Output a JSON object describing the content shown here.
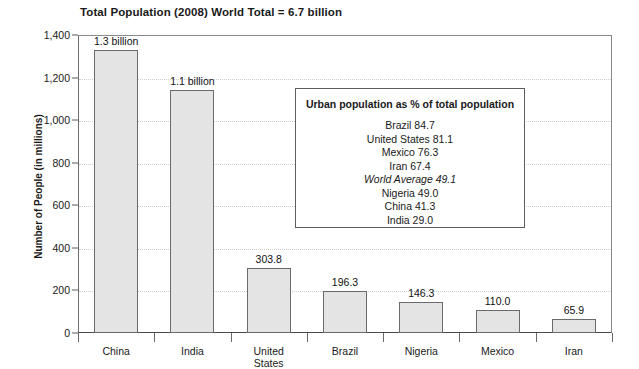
{
  "chart_data": {
    "type": "bar",
    "title": "Total Population (2008) World Total = 6.7 billion",
    "xlabel": "",
    "ylabel": "Number of People (in millions)",
    "ylim": [
      0,
      1400
    ],
    "yticks": [
      0,
      200,
      400,
      600,
      800,
      1000,
      1200,
      1400
    ],
    "ytick_labels": [
      "0",
      "200",
      "400",
      "600",
      "800",
      "1,000",
      "1,200",
      "1,400"
    ],
    "grid": true,
    "legend_position": "inside-upper-right",
    "categories": [
      "China",
      "India",
      "United\nStates",
      "Brazil",
      "Nigeria",
      "Mexico",
      "Iran"
    ],
    "values": [
      1330,
      1140,
      303.8,
      196.3,
      146.3,
      110.0,
      65.9
    ],
    "data_labels": [
      "1.3 billion",
      "1.1 billion",
      "303.8",
      "196.3",
      "146.3",
      "110.0",
      "65.9"
    ],
    "bar_fill_color": "#e4e4e4",
    "bar_border_color": "#6a6a6a",
    "annotation": {
      "title": "Urban population as % of total population",
      "rows": [
        {
          "label": "Brazil 84.7",
          "italic": false
        },
        {
          "label": "United States 81.1",
          "italic": false
        },
        {
          "label": "Mexico 76.3",
          "italic": false
        },
        {
          "label": "Iran 67.4",
          "italic": false
        },
        {
          "label": "World Average 49.1",
          "italic": true
        },
        {
          "label": "Nigeria 49.0",
          "italic": false
        },
        {
          "label": "China 41.3",
          "italic": false
        },
        {
          "label": "India 29.0",
          "italic": false
        }
      ]
    }
  }
}
